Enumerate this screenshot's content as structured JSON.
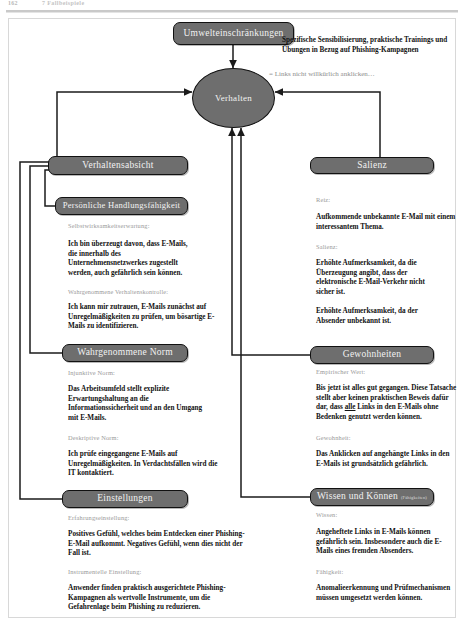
{
  "header": {
    "folio": "162",
    "running_title": "7 Fallbeispiele"
  },
  "hub": {
    "label": "Verhalten"
  },
  "nodes": {
    "umwelt": "Umwelteinschränkungen",
    "verhaltensabsicht": "Verhaltensabsicht",
    "handlungsfaehigkeit": "Persönliche Handlungsfähigkeit",
    "norm": "Wahrgenommene Norm",
    "einstellungen": "Einstellungen",
    "salienz": "Salienz",
    "gewohnheiten": "Gewohnheiten",
    "wissen": "Wissen und Können",
    "wissen_sub": "(Fähigkeiten)"
  },
  "annotations": {
    "umwelt_note": "Spezifische Sensibilisierung, praktische Trainings und Übungen in Bezug auf Phishing-Kampagnen",
    "verhalten_note": "= Links nicht willkürlich anklicken…"
  },
  "left_column": {
    "handlungsfaehigkeit": {
      "sub1_label": "Selbstwirksamkeitserwartung:",
      "sub1_text": "Ich bin überzeugt davon, dass E-Mails, die innerhalb des Unternehmensnetzwerkes zugestellt werden, auch gefährlich sein können.",
      "sub2_label": "Wahrgenommene Verhaltenskontrolle:",
      "sub2_text": "Ich kann mir zutrauen, E-Mails zunächst auf Unregelmäßigkeiten zu prüfen, um bösartige E-Mails zu identifizieren."
    },
    "norm": {
      "sub1_label": "Injunktive Norm:",
      "sub1_text": "Das Arbeitsumfeld stellt explizite Erwartungshaltung an die Informationssicherheit und an den Umgang mit E-Mails.",
      "sub2_label": "Deskriptive Norm:",
      "sub2_text": "Ich prüfe eingegangene E-Mails auf Unregelmäßigkeiten. In Verdachtsfällen wird die IT kontaktiert."
    },
    "einstellungen": {
      "sub1_label": "Erfahrungseinstellung:",
      "sub1_text": "Positives Gefühl, welches beim Entdecken einer Phishing-E-Mail aufkommt. Negatives Gefühl, wenn dies nicht der Fall ist.",
      "sub2_label": "Instrumentelle Einstellung:",
      "sub2_text": "Anwender finden praktisch ausgerichtete Phishing-Kampagnen als wertvolle Instrumente, um die Gefahrenlage beim Phishing zu reduzieren."
    }
  },
  "right_column": {
    "salienz": {
      "sub1_label": "Reiz:",
      "sub1_text": "Aufkommende unbekannte E-Mail mit einem interessantem Thema.",
      "sub2_label": "Salienz:",
      "sub2_text": "Erhöhte Aufmerksamkeit, da die Überzeugung angibt, dass der elektronische E-Mail-Verkehr nicht sicher ist.",
      "sub2_text_b": "Erhöhte Aufmerksamkeit, da der Absender unbekannt ist."
    },
    "gewohnheiten": {
      "sub1_label": "Empirischer Wert:",
      "sub1_text_a": "Bis jetzt ist alles gut gegangen. Diese Tatsache stellt aber keinen praktischen Beweis dafür dar, dass ",
      "sub1_emph": "alle",
      "sub1_text_b": " Links in den E-Mails ohne Bedenken genutzt werden können.",
      "sub2_label": "Gewohnheit:",
      "sub2_text": "Das Anklicken auf angehängte Links in den E-Mails ist grundsätzlich gefährlich."
    },
    "wissen": {
      "sub1_label": "Wissen:",
      "sub1_text": "Angeheftete Links in E-Mails können gefährlich sein. Insbesondere auch die E-Mails eines fremden Absenders.",
      "sub2_label": "Fähigkeit:",
      "sub2_text": "Anomalieerkennung und Prüfmechanismen müssen umgesetzt werden können."
    }
  },
  "colors": {
    "node_fill": "#6e6e6e",
    "node_stroke": "#111111",
    "wire": "#1b1b1b",
    "subhead": "#9a9a9a"
  }
}
